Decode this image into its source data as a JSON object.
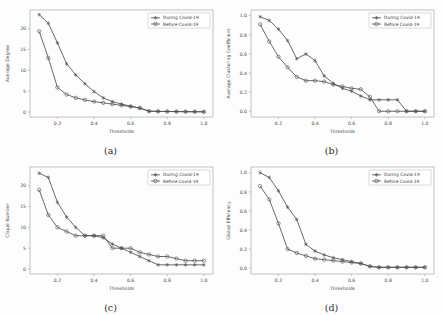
{
  "figure": {
    "background": "#fdfdfd",
    "series_colors": {
      "during": "#4f4f4f",
      "before": "#4f4f4f"
    },
    "marker_during": "star",
    "marker_before": "circle"
  },
  "legend": {
    "during_label": "During Covid-19",
    "before_label": "Before Covid-19"
  },
  "panels": [
    {
      "caption": "(a)",
      "key": "a"
    },
    {
      "caption": "(b)",
      "key": "b"
    },
    {
      "caption": "(c)",
      "key": "c"
    },
    {
      "caption": "(d)",
      "key": "d"
    }
  ],
  "chart_data": [
    {
      "type": "line",
      "panel": "(a)",
      "title": "",
      "xlabel": "Thresholds",
      "ylabel": "Average Degree",
      "xlim": [
        0.05,
        1.05
      ],
      "ylim": [
        -1.2,
        24.5
      ],
      "xticks": [
        0.2,
        0.4,
        0.6,
        0.8,
        1.0
      ],
      "xticklabels": [
        "0.2",
        "0.4",
        "0.6",
        "0.8",
        "1.0"
      ],
      "yticks": [
        0,
        5,
        10,
        15,
        20
      ],
      "yticklabels": [
        "0",
        "5",
        "10",
        "15",
        "20"
      ],
      "grid": false,
      "legend_position": "upper right",
      "x": [
        0.1,
        0.15,
        0.2,
        0.25,
        0.3,
        0.35,
        0.4,
        0.45,
        0.5,
        0.55,
        0.6,
        0.65,
        0.7,
        0.75,
        0.8,
        0.85,
        0.9,
        0.95,
        1.0
      ],
      "series": [
        {
          "name": "During Covid-19",
          "values": [
            23.4,
            21.3,
            16.6,
            11.6,
            8.9,
            6.8,
            4.9,
            3.4,
            2.5,
            1.9,
            1.4,
            0.9,
            0.2,
            0.15,
            0.12,
            0.1,
            0.08,
            0.06,
            0.05
          ]
        },
        {
          "name": "Before Covid-19",
          "values": [
            19.4,
            13.0,
            5.9,
            4.2,
            3.4,
            2.9,
            2.5,
            2.2,
            1.9,
            1.6,
            1.3,
            1.0,
            0.2,
            0.15,
            0.12,
            0.1,
            0.08,
            0.06,
            0.05
          ]
        }
      ]
    },
    {
      "type": "line",
      "panel": "(b)",
      "title": "",
      "xlabel": "Thresholds",
      "ylabel": "Average Clustering Coefficient",
      "xlim": [
        0.05,
        1.05
      ],
      "ylim": [
        -0.06,
        1.06
      ],
      "xticks": [
        0.2,
        0.4,
        0.6,
        0.8,
        1.0
      ],
      "xticklabels": [
        "0.2",
        "0.4",
        "0.6",
        "0.8",
        "1.0"
      ],
      "yticks": [
        0.0,
        0.2,
        0.4,
        0.6,
        0.8,
        1.0
      ],
      "yticklabels": [
        "0.0",
        "0.2",
        "0.4",
        "0.6",
        "0.8",
        "1.0"
      ],
      "grid": false,
      "legend_position": "upper right",
      "x": [
        0.1,
        0.15,
        0.2,
        0.25,
        0.3,
        0.35,
        0.4,
        0.45,
        0.5,
        0.55,
        0.6,
        0.65,
        0.7,
        0.75,
        0.8,
        0.85,
        0.9,
        0.95,
        1.0
      ],
      "series": [
        {
          "name": "During Covid-19",
          "values": [
            0.99,
            0.95,
            0.86,
            0.74,
            0.55,
            0.6,
            0.53,
            0.37,
            0.29,
            0.24,
            0.21,
            0.16,
            0.12,
            0.12,
            0.12,
            0.12,
            0.0,
            0.0,
            0.0
          ]
        },
        {
          "name": "Before Covid-19",
          "values": [
            0.91,
            0.73,
            0.57,
            0.46,
            0.36,
            0.32,
            0.32,
            0.31,
            0.28,
            0.26,
            0.24,
            0.23,
            0.15,
            0.0,
            0.0,
            0.0,
            0.0,
            0.0,
            0.0
          ]
        }
      ]
    },
    {
      "type": "line",
      "panel": "(c)",
      "title": "",
      "xlabel": "Thresholds",
      "ylabel": "Clique Number",
      "xlim": [
        0.05,
        1.05
      ],
      "ylim": [
        -1.2,
        24.5
      ],
      "xticks": [
        0.2,
        0.4,
        0.6,
        0.8,
        1.0
      ],
      "xticklabels": [
        "0.2",
        "0.4",
        "0.6",
        "0.8",
        "1.0"
      ],
      "yticks": [
        0,
        5,
        10,
        15,
        20
      ],
      "yticklabels": [
        "0",
        "5",
        "10",
        "15",
        "20"
      ],
      "grid": false,
      "legend_position": "upper right",
      "x": [
        0.1,
        0.15,
        0.2,
        0.25,
        0.3,
        0.35,
        0.4,
        0.45,
        0.5,
        0.55,
        0.6,
        0.65,
        0.7,
        0.75,
        0.8,
        0.85,
        0.9,
        0.95,
        1.0
      ],
      "series": [
        {
          "name": "During Covid-19",
          "values": [
            23.0,
            22.0,
            16.0,
            12.5,
            10.0,
            8.0,
            8.0,
            7.5,
            6.0,
            5.0,
            4.0,
            3.0,
            2.0,
            1.0,
            1.0,
            1.0,
            1.0,
            1.0,
            1.0
          ]
        },
        {
          "name": "Before Covid-19",
          "values": [
            19.0,
            13.0,
            10.0,
            9.0,
            8.0,
            8.0,
            8.0,
            8.0,
            5.0,
            5.0,
            5.0,
            4.0,
            3.5,
            3.0,
            3.0,
            2.5,
            2.0,
            2.0,
            2.0
          ]
        }
      ]
    },
    {
      "type": "line",
      "panel": "(d)",
      "title": "",
      "xlabel": "Thresholds",
      "ylabel": "Global Efficiency",
      "xlim": [
        0.05,
        1.05
      ],
      "ylim": [
        -0.06,
        1.06
      ],
      "xticks": [
        0.2,
        0.4,
        0.6,
        0.8,
        1.0
      ],
      "xticklabels": [
        "0.2",
        "0.4",
        "0.6",
        "0.8",
        "1.0"
      ],
      "yticks": [
        0.0,
        0.2,
        0.4,
        0.6,
        0.8,
        1.0
      ],
      "yticklabels": [
        "0.0",
        "0.2",
        "0.4",
        "0.6",
        "0.8",
        "1.0"
      ],
      "grid": false,
      "legend_position": "upper right",
      "x": [
        0.1,
        0.15,
        0.2,
        0.25,
        0.3,
        0.35,
        0.4,
        0.45,
        0.5,
        0.55,
        0.6,
        0.65,
        0.7,
        0.75,
        0.8,
        0.85,
        0.9,
        0.95,
        1.0
      ],
      "series": [
        {
          "name": "During Covid-19",
          "values": [
            1.0,
            0.95,
            0.81,
            0.64,
            0.51,
            0.25,
            0.18,
            0.14,
            0.11,
            0.09,
            0.07,
            0.05,
            0.02,
            0.01,
            0.01,
            0.01,
            0.01,
            0.01,
            0.01
          ]
        },
        {
          "name": "Before Covid-19",
          "values": [
            0.86,
            0.72,
            0.47,
            0.2,
            0.16,
            0.13,
            0.1,
            0.09,
            0.08,
            0.07,
            0.06,
            0.05,
            0.02,
            0.01,
            0.01,
            0.01,
            0.01,
            0.01,
            0.01
          ]
        }
      ]
    }
  ]
}
